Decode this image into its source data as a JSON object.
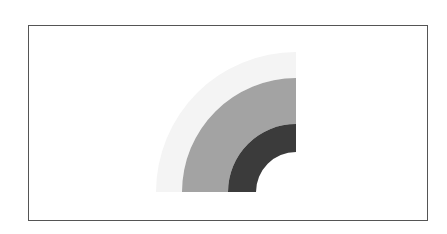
{
  "chart_data": {
    "type": "pie",
    "variant": "concentric-quarter-ring",
    "title": "",
    "legend": [],
    "center": [
      296,
      192
    ],
    "start_angle_deg": 180,
    "end_angle_deg": 270,
    "rings": [
      {
        "name": "outer",
        "inner_radius": 114,
        "outer_radius": 140,
        "color": "#f4f4f4"
      },
      {
        "name": "middle",
        "inner_radius": 68,
        "outer_radius": 114,
        "color": "#a3a3a3"
      },
      {
        "name": "inner",
        "inner_radius": 40,
        "outer_radius": 68,
        "color": "#3b3b3b"
      }
    ],
    "frame": {
      "x": 28,
      "y": 25,
      "width": 400,
      "height": 196,
      "border_color": "#555555"
    }
  }
}
